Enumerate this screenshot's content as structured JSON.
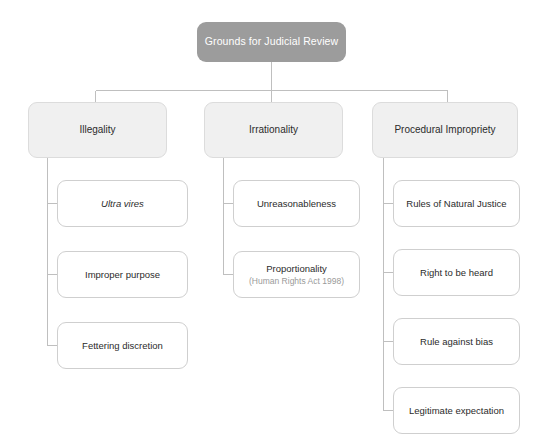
{
  "diagram": {
    "type": "hierarchy-tree",
    "background_color": "#ffffff",
    "root": {
      "label": "Grounds for Judicial Review",
      "fill_color": "#9c9c9c",
      "text_color": "#ffffff"
    },
    "branch_style": {
      "fill_color": "#f0f0f0",
      "border_color": "#dcdcdc",
      "text_color": "#2b2b2b"
    },
    "leaf_style": {
      "fill_color": "#ffffff",
      "border_color": "#cfcfcf",
      "text_color": "#2b2b2b"
    },
    "connector_color": "#bfbfbf",
    "branches": [
      {
        "label": "Illegality",
        "children": [
          {
            "label": "Ultra vires",
            "italic": true,
            "sublabel": ""
          },
          {
            "label": "Improper purpose",
            "italic": false,
            "sublabel": ""
          },
          {
            "label": "Fettering discretion",
            "italic": false,
            "sublabel": ""
          }
        ]
      },
      {
        "label": "Irrationality",
        "children": [
          {
            "label": "Unreasonableness",
            "italic": false,
            "sublabel": ""
          },
          {
            "label": "Proportionality",
            "italic": false,
            "sublabel": "(Human Rights Act 1998)"
          }
        ]
      },
      {
        "label": "Procedural Impropriety",
        "children": [
          {
            "label": "Rules of Natural Justice",
            "italic": false,
            "sublabel": ""
          },
          {
            "label": "Right to be heard",
            "italic": false,
            "sublabel": ""
          },
          {
            "label": "Rule against bias",
            "italic": false,
            "sublabel": ""
          },
          {
            "label": "Legitimate expectation",
            "italic": false,
            "sublabel": ""
          }
        ]
      }
    ]
  }
}
